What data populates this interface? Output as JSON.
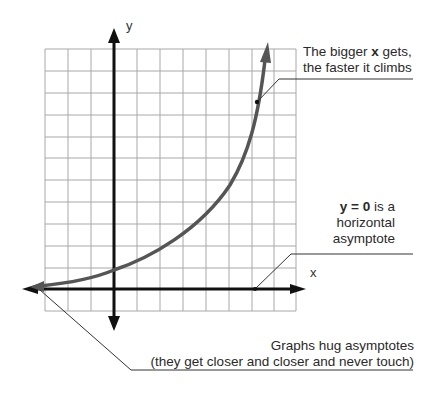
{
  "diagram": {
    "axes": {
      "x_label": "x",
      "y_label": "y"
    },
    "grid": {
      "columns": 11,
      "rows": 12,
      "color": "#9a9a9a"
    },
    "curve": {
      "type": "exponential",
      "color": "#555555",
      "description": "Rises slowly near y=0 on the left, crosses y-axis about one unit above origin, climbs steeply on the right"
    },
    "annotations": {
      "top": {
        "line1_pre": "The bigger ",
        "line1_bold": "x",
        "line1_post": " gets,",
        "line2": "the faster it climbs"
      },
      "middle": {
        "line1_bold": "y = 0",
        "line1_post": " is a",
        "line2": "horizontal",
        "line3": "asymptote"
      },
      "bottom": {
        "line1": "Graphs hug asymptotes",
        "line2": "(they get closer and closer and never touch)"
      }
    },
    "colors": {
      "axis": "#111111",
      "curve": "#555555",
      "grid": "#9a9a9a",
      "leader": "#333333"
    }
  }
}
